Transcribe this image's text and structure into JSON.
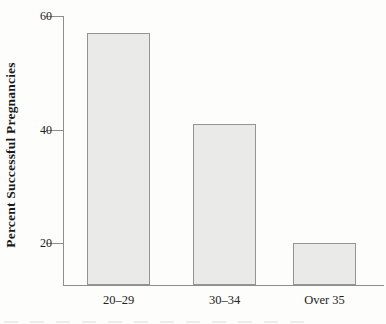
{
  "figure": {
    "background_color": "#fdfdfb",
    "text_color": "#1c1c1c"
  },
  "chart_data": {
    "type": "bar",
    "title": "",
    "xlabel": "",
    "ylabel": "Percent Successful Pregnancies",
    "categories": [
      "20–29",
      "30–34",
      "Over 35"
    ],
    "values": [
      57,
      41,
      20
    ],
    "yticks": [
      60,
      40,
      20
    ],
    "ylim": [
      12.5,
      60
    ],
    "grid": false,
    "legend": "none",
    "bar_fill_color": "#eaeae8",
    "bar_border_color": "#949494",
    "axis_color": "#8e8e8e"
  }
}
